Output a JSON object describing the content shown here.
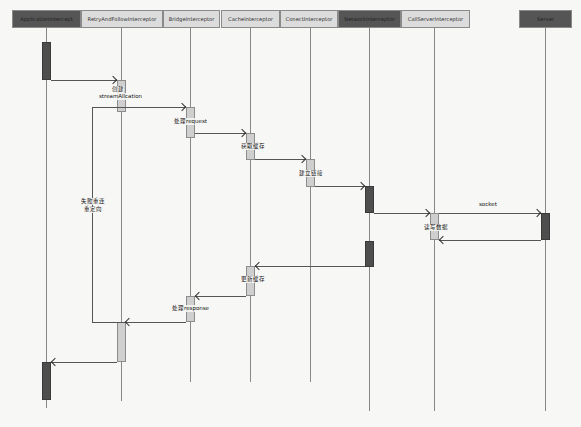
{
  "diagram": {
    "type": "sequence",
    "participants": [
      {
        "name": "ApplicationIntercept",
        "style": "dark"
      },
      {
        "name": "RetryAndFollowInterceptor",
        "style": "light"
      },
      {
        "name": "BridgeInterceptor",
        "style": "light"
      },
      {
        "name": "CacheInterceptor",
        "style": "light"
      },
      {
        "name": "ConectInterceptor",
        "style": "light"
      },
      {
        "name": "NetworkInterceptor",
        "style": "dark"
      },
      {
        "name": "CallServerInterceptor",
        "style": "light"
      },
      {
        "name": "Server",
        "style": "dark"
      }
    ],
    "messages": [
      {
        "from": "ApplicationIntercept",
        "to": "RetryAndFollowInterceptor",
        "label_line1": "创建",
        "label_line2": "streamAllcation"
      },
      {
        "from": "RetryAndFollowInterceptor",
        "to": "BridgeInterceptor",
        "label": "处理request"
      },
      {
        "from": "BridgeInterceptor",
        "to": "CacheInterceptor",
        "label": "获取缓存"
      },
      {
        "from": "CacheInterceptor",
        "to": "ConectInterceptor",
        "label": "建立链接"
      },
      {
        "from": "ConectInterceptor",
        "to": "NetworkInterceptor",
        "label": ""
      },
      {
        "from": "NetworkInterceptor",
        "to": "CallServerInterceptor",
        "label": ""
      },
      {
        "from": "CallServerInterceptor",
        "to": "Server",
        "label": "socket"
      },
      {
        "from": "Server",
        "to": "CallServerInterceptor",
        "label": "读写数据"
      },
      {
        "from": "NetworkInterceptor",
        "to": "CacheInterceptor",
        "label": "更新缓存"
      },
      {
        "from": "CacheInterceptor",
        "to": "BridgeInterceptor",
        "label": "处理response"
      },
      {
        "from": "BridgeInterceptor",
        "to": "RetryAndFollowInterceptor",
        "label": ""
      },
      {
        "from": "RetryAndFollowInterceptor",
        "to": "ApplicationIntercept",
        "label": ""
      }
    ],
    "loop": {
      "label_line1": "失败重连",
      "label_line2": "重定向"
    },
    "colors": {
      "dark_box": "#555555",
      "light_box": "#dcdcdc",
      "line": "#555555",
      "background": "#f7f7f5"
    }
  }
}
